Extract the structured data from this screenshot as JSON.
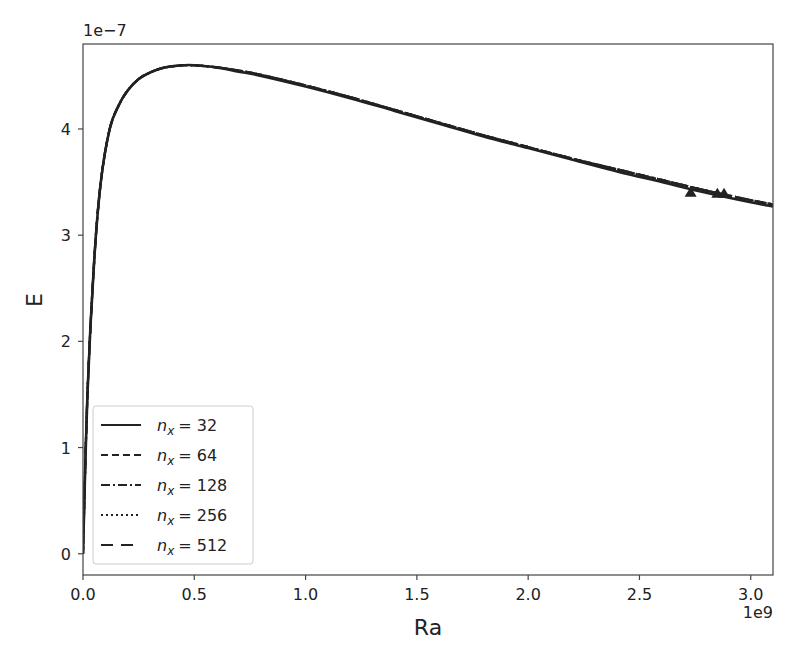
{
  "chart_data": {
    "type": "line",
    "title": "",
    "xlabel": "Ra",
    "ylabel": "E",
    "x_offset_label": "1e9",
    "y_offset_label": "1e−7",
    "xlim": [
      0.0,
      3.1
    ],
    "ylim": [
      -0.2,
      4.8
    ],
    "x_ticks": [
      "0.0",
      "0.5",
      "1.0",
      "1.5",
      "2.0",
      "2.5",
      "3.0"
    ],
    "x_tick_values": [
      0.0,
      0.5,
      1.0,
      1.5,
      2.0,
      2.5,
      3.0
    ],
    "y_ticks": [
      "0",
      "1",
      "2",
      "3",
      "4"
    ],
    "y_tick_values": [
      0,
      1,
      2,
      3,
      4
    ],
    "grid": false,
    "legend_position": "lower left",
    "x": [
      0.0,
      0.02,
      0.05,
      0.08,
      0.12,
      0.16,
      0.2,
      0.25,
      0.3,
      0.35,
      0.4,
      0.45,
      0.5,
      0.6,
      0.7,
      0.8,
      1.0,
      1.2,
      1.4,
      1.6,
      1.8,
      2.0,
      2.2,
      2.4,
      2.6,
      2.8,
      3.0,
      3.1
    ],
    "series": [
      {
        "name": "n_x = 32",
        "label_base": "n",
        "label_sub": "x",
        "label_value": "= 32",
        "dash": "solid",
        "values": [
          0.0,
          1.5,
          2.75,
          3.5,
          4.0,
          4.22,
          4.36,
          4.47,
          4.53,
          4.57,
          4.59,
          4.6,
          4.6,
          4.58,
          4.54,
          4.5,
          4.4,
          4.29,
          4.17,
          4.05,
          3.93,
          3.82,
          3.71,
          3.6,
          3.5,
          3.4,
          3.31,
          3.27
        ]
      },
      {
        "name": "n_x = 64",
        "label_base": "n",
        "label_sub": "x",
        "label_value": "= 64",
        "dash": "dashed",
        "values": [
          0.0,
          1.5,
          2.75,
          3.5,
          4.0,
          4.22,
          4.36,
          4.47,
          4.53,
          4.57,
          4.59,
          4.6,
          4.6,
          4.58,
          4.55,
          4.51,
          4.41,
          4.3,
          4.18,
          4.06,
          3.94,
          3.83,
          3.72,
          3.62,
          3.52,
          3.42,
          3.33,
          3.29
        ]
      },
      {
        "name": "n_x = 128",
        "label_base": "n",
        "label_sub": "x",
        "label_value": "= 128",
        "dash": "dashdot",
        "values": [
          0.0,
          1.5,
          2.75,
          3.5,
          4.0,
          4.22,
          4.36,
          4.47,
          4.53,
          4.57,
          4.59,
          4.6,
          4.6,
          4.58,
          4.55,
          4.51,
          4.41,
          4.3,
          4.18,
          4.06,
          3.94,
          3.83,
          3.72,
          3.62,
          3.52,
          3.42,
          3.33,
          3.29
        ]
      },
      {
        "name": "n_x = 256",
        "label_base": "n",
        "label_sub": "x",
        "label_value": "= 256",
        "dash": "dotted",
        "values": [
          0.0,
          1.5,
          2.75,
          3.5,
          4.0,
          4.22,
          4.36,
          4.47,
          4.53,
          4.57,
          4.59,
          4.6,
          4.6,
          4.58,
          4.55,
          4.51,
          4.41,
          4.3,
          4.18,
          4.06,
          3.94,
          3.83,
          3.72,
          3.62,
          3.52,
          3.42,
          3.33,
          3.29
        ]
      },
      {
        "name": "n_x = 512",
        "label_base": "n",
        "label_sub": "x",
        "label_value": "= 512",
        "dash": "longdash",
        "values": [
          0.0,
          1.5,
          2.75,
          3.5,
          4.0,
          4.22,
          4.36,
          4.47,
          4.53,
          4.57,
          4.59,
          4.6,
          4.6,
          4.58,
          4.55,
          4.51,
          4.41,
          4.3,
          4.18,
          4.06,
          3.94,
          3.83,
          3.72,
          3.62,
          3.52,
          3.42,
          3.33,
          3.29
        ]
      }
    ],
    "markers": {
      "shape": "triangle",
      "points": [
        {
          "x": 2.73,
          "y": 3.4
        },
        {
          "x": 2.85,
          "y": 3.39
        },
        {
          "x": 2.88,
          "y": 3.39
        }
      ]
    },
    "colors": {
      "line": "#222222",
      "axis": "#444444",
      "legend_border": "#cccccc",
      "background": "#ffffff"
    }
  }
}
